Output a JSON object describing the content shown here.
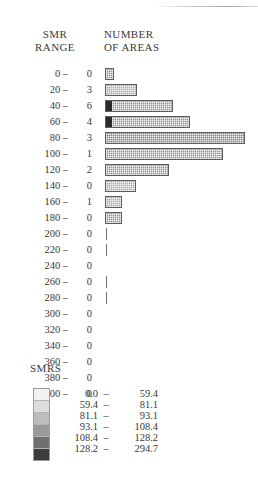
{
  "figure": {
    "header_left_line1": "SMR",
    "header_left_line2": "RANGE",
    "header_right_line1": "NUMBER",
    "header_right_line2": "OF AREAS"
  },
  "legend": {
    "title": "SMRS",
    "dash": "–",
    "rows": [
      {
        "low": "0.0",
        "high": "59.4",
        "color": "#f2f2f2"
      },
      {
        "low": "59.4",
        "high": "81.1",
        "color": "#dcdcdc"
      },
      {
        "low": "81.1",
        "high": "93.1",
        "color": "#bdbdbd"
      },
      {
        "low": "93.1",
        "high": "108.4",
        "color": "#9a9a9a"
      },
      {
        "low": "108.4",
        "high": "128.2",
        "color": "#6f6f6f"
      },
      {
        "low": "128.2",
        "high": "294.7",
        "color": "#3d3d3d"
      }
    ]
  },
  "chart_data": {
    "type": "bar",
    "orientation": "horizontal",
    "title": "",
    "xlabel": "",
    "ylabel": "SMR RANGE",
    "categories": [
      "0 –",
      "20 –",
      "40 –",
      "60 –",
      "80 –",
      "100 –",
      "120 –",
      "140 –",
      "160 –",
      "180 –",
      "200 –",
      "220 –",
      "240 –",
      "260 –",
      "280 –",
      "300 –",
      "320 –",
      "340 –",
      "360 –",
      "380 –",
      "400 –"
    ],
    "counts": [
      0,
      3,
      6,
      4,
      3,
      1,
      2,
      0,
      1,
      0,
      0,
      0,
      0,
      0,
      0,
      0,
      0,
      0,
      0,
      0,
      0
    ],
    "bar_lengths_px": [
      9,
      32,
      68,
      85,
      140,
      118,
      64,
      31,
      17,
      17,
      1,
      1,
      0,
      1,
      1,
      0,
      0,
      0,
      0,
      0,
      0
    ],
    "bar_shades": [
      "mid",
      "light",
      "cap",
      "cap",
      "dark",
      "mid",
      "mid",
      "light",
      "light",
      "mid",
      "tick",
      "tick",
      "none",
      "tick",
      "tick",
      "none",
      "none",
      "none",
      "none",
      "none",
      "none"
    ],
    "legend_position": "bottom-left",
    "grid": false
  }
}
